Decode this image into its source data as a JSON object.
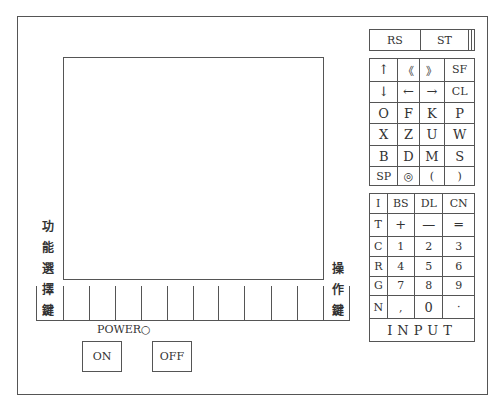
{
  "panel": {
    "left_label_chars": [
      "功",
      "能",
      "選",
      "擇",
      "鍵"
    ],
    "right_label_chars": [
      "操",
      "作",
      "鍵"
    ],
    "soft_key_count": 11
  },
  "keys": {
    "top_row": [
      "RS",
      "ST",
      "",
      ""
    ],
    "alpha_block": [
      [
        "↑",
        "《",
        "》",
        "SF"
      ],
      [
        "↓",
        "←",
        "→",
        "CL"
      ],
      [
        "O",
        "F",
        "K",
        "P"
      ],
      [
        "X",
        "Z",
        "U",
        "W"
      ],
      [
        "B",
        "D",
        "M",
        "S"
      ],
      [
        "SP",
        "◎",
        "(",
        ")"
      ]
    ],
    "numeric_block": [
      [
        "I",
        "BS",
        "DL",
        "CN"
      ],
      [
        "T",
        "+",
        "—",
        "═"
      ],
      [
        "C",
        "1",
        "2",
        "3"
      ],
      [
        "R",
        "4",
        "5",
        "6"
      ],
      [
        "G",
        "7",
        "8",
        "9"
      ],
      [
        "N",
        ",",
        "0",
        "·"
      ]
    ],
    "input_label": "INPUT"
  },
  "power": {
    "label": "POWER○",
    "on_label": "ON",
    "off_label": "OFF"
  }
}
